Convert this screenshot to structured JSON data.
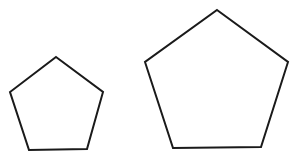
{
  "figure": {
    "background": "#ffffff",
    "stroke_color": "#1a1a1a",
    "shapes": [
      {
        "name": "small-pentagon",
        "type": "regular-pentagon",
        "points": "56,57 103,92 87,149 29,150 10,92"
      },
      {
        "name": "large-pentagon",
        "type": "regular-pentagon",
        "points": "217,10 288,62 261,147 173,148 145,62"
      }
    ]
  }
}
